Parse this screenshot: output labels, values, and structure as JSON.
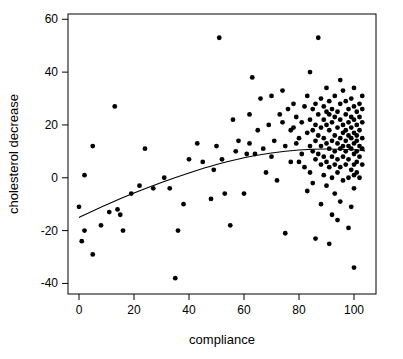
{
  "chart_data": {
    "type": "scatter",
    "title": "",
    "xlabel": "compliance",
    "ylabel": "cholesterol decrease",
    "xlim": [
      -4,
      108
    ],
    "ylim": [
      -44,
      62
    ],
    "xticks": [
      0,
      20,
      40,
      60,
      80,
      100
    ],
    "yticks": [
      -40,
      -20,
      0,
      20,
      40,
      60
    ],
    "grid": false,
    "legend": null,
    "point_color": "#000000",
    "line_color": "#000000",
    "series": [
      {
        "name": "observations",
        "points": [
          [
            0,
            -11
          ],
          [
            1,
            -24
          ],
          [
            2,
            -20
          ],
          [
            2,
            1
          ],
          [
            5,
            -29
          ],
          [
            5,
            12
          ],
          [
            8,
            -18
          ],
          [
            11,
            -13
          ],
          [
            13,
            27
          ],
          [
            14,
            -12
          ],
          [
            15,
            -14
          ],
          [
            16,
            -20
          ],
          [
            19,
            -6
          ],
          [
            22,
            -3
          ],
          [
            24,
            11
          ],
          [
            27,
            -4
          ],
          [
            31,
            0
          ],
          [
            33,
            -4
          ],
          [
            35,
            -38
          ],
          [
            36,
            -20
          ],
          [
            38,
            -10
          ],
          [
            40,
            7
          ],
          [
            43,
            13
          ],
          [
            45,
            6
          ],
          [
            48,
            -8
          ],
          [
            49,
            3
          ],
          [
            50,
            12
          ],
          [
            51,
            53
          ],
          [
            52,
            7
          ],
          [
            53,
            -6
          ],
          [
            55,
            -18
          ],
          [
            57,
            10
          ],
          [
            58,
            14
          ],
          [
            60,
            -6
          ],
          [
            61,
            9
          ],
          [
            62,
            24
          ],
          [
            63,
            38
          ],
          [
            64,
            9
          ],
          [
            65,
            18
          ],
          [
            66,
            30
          ],
          [
            67,
            11
          ],
          [
            68,
            2
          ],
          [
            69,
            20
          ],
          [
            70,
            8
          ],
          [
            71,
            14
          ],
          [
            72,
            -1
          ],
          [
            73,
            24
          ],
          [
            74,
            21
          ],
          [
            75,
            12
          ],
          [
            75,
            -21
          ],
          [
            76,
            26
          ],
          [
            77,
            18
          ],
          [
            77,
            6
          ],
          [
            78,
            19
          ],
          [
            78,
            28
          ],
          [
            79,
            13
          ],
          [
            79,
            23
          ],
          [
            80,
            15
          ],
          [
            80,
            6
          ],
          [
            81,
            21
          ],
          [
            81,
            9
          ],
          [
            82,
            4
          ],
          [
            82,
            27
          ],
          [
            83,
            17
          ],
          [
            83,
            31
          ],
          [
            83,
            -5
          ],
          [
            84,
            12
          ],
          [
            84,
            22
          ],
          [
            84,
            2
          ],
          [
            85,
            10
          ],
          [
            85,
            26
          ],
          [
            85,
            18
          ],
          [
            85,
            -2
          ],
          [
            86,
            14
          ],
          [
            86,
            28
          ],
          [
            86,
            7
          ],
          [
            86,
            20
          ],
          [
            87,
            53
          ],
          [
            87,
            16
          ],
          [
            87,
            9
          ],
          [
            87,
            24
          ],
          [
            88,
            12
          ],
          [
            88,
            19
          ],
          [
            88,
            5
          ],
          [
            88,
            30
          ],
          [
            88,
            -10
          ],
          [
            89,
            15
          ],
          [
            89,
            22
          ],
          [
            89,
            8
          ],
          [
            89,
            27
          ],
          [
            89,
            1
          ],
          [
            90,
            13
          ],
          [
            90,
            20
          ],
          [
            90,
            6
          ],
          [
            90,
            25
          ],
          [
            90,
            34
          ],
          [
            90,
            -3
          ],
          [
            91,
            11
          ],
          [
            91,
            18
          ],
          [
            91,
            24
          ],
          [
            91,
            4
          ],
          [
            91,
            29
          ],
          [
            92,
            14
          ],
          [
            92,
            21
          ],
          [
            92,
            8
          ],
          [
            92,
            0
          ],
          [
            92,
            26
          ],
          [
            92,
            -14
          ],
          [
            93,
            16
          ],
          [
            93,
            10
          ],
          [
            93,
            23
          ],
          [
            93,
            5
          ],
          [
            93,
            31
          ],
          [
            93,
            -6
          ],
          [
            94,
            13
          ],
          [
            94,
            19
          ],
          [
            94,
            7
          ],
          [
            94,
            25
          ],
          [
            94,
            2
          ],
          [
            94,
            -16
          ],
          [
            95,
            15
          ],
          [
            95,
            11
          ],
          [
            95,
            22
          ],
          [
            95,
            28
          ],
          [
            95,
            4
          ],
          [
            95,
            -9
          ],
          [
            96,
            17
          ],
          [
            96,
            12
          ],
          [
            96,
            20
          ],
          [
            96,
            8
          ],
          [
            96,
            33
          ],
          [
            96,
            -1
          ],
          [
            97,
            14
          ],
          [
            97,
            24
          ],
          [
            97,
            10
          ],
          [
            97,
            18
          ],
          [
            97,
            5
          ],
          [
            97,
            29
          ],
          [
            98,
            16
          ],
          [
            98,
            12
          ],
          [
            98,
            21
          ],
          [
            98,
            7
          ],
          [
            98,
            26
          ],
          [
            98,
            0
          ],
          [
            99,
            15
          ],
          [
            99,
            19
          ],
          [
            99,
            11
          ],
          [
            99,
            23
          ],
          [
            99,
            3
          ],
          [
            99,
            30
          ],
          [
            99,
            -11
          ],
          [
            100,
            13
          ],
          [
            100,
            17
          ],
          [
            100,
            9
          ],
          [
            100,
            22
          ],
          [
            100,
            27
          ],
          [
            100,
            5
          ],
          [
            100,
            1
          ],
          [
            100,
            -4
          ],
          [
            100,
            34
          ],
          [
            100,
            -34
          ],
          [
            101,
            14
          ],
          [
            101,
            20
          ],
          [
            101,
            10
          ],
          [
            101,
            25
          ],
          [
            101,
            6
          ],
          [
            101,
            16
          ],
          [
            101,
            2
          ],
          [
            102,
            12
          ],
          [
            102,
            18
          ],
          [
            102,
            23
          ],
          [
            102,
            8
          ],
          [
            102,
            28
          ],
          [
            102,
            0
          ],
          [
            103,
            15
          ],
          [
            103,
            11
          ],
          [
            103,
            21
          ],
          [
            103,
            5
          ],
          [
            103,
            26
          ],
          [
            103,
            31
          ],
          [
            84,
            40
          ],
          [
            95,
            37
          ],
          [
            86,
            -23
          ],
          [
            91,
            -25
          ],
          [
            98,
            -19
          ],
          [
            74,
            33
          ],
          [
            62,
            13
          ],
          [
            70,
            31
          ],
          [
            56,
            22
          ]
        ]
      }
    ],
    "fitted_curve": {
      "name": "quadratic fit",
      "points": [
        [
          0,
          -15
        ],
        [
          10,
          -10.2
        ],
        [
          20,
          -5.8
        ],
        [
          30,
          -1.8
        ],
        [
          40,
          1.8
        ],
        [
          50,
          5.0
        ],
        [
          60,
          7.6
        ],
        [
          70,
          9.4
        ],
        [
          80,
          10.5
        ],
        [
          90,
          10.9
        ],
        [
          100,
          10.6
        ],
        [
          104,
          10.2
        ]
      ]
    }
  }
}
